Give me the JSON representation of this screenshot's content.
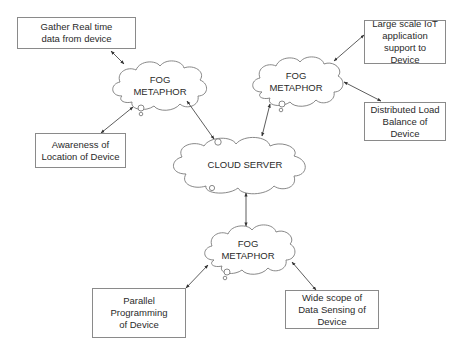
{
  "diagram": {
    "colors": {
      "stroke": "#7a7a7a",
      "arrow": "#333333",
      "box_border": "#8a8a8a",
      "text": "#2a2a2a"
    },
    "clouds": {
      "fog_top_left": {
        "line1": "FOG",
        "line2": "METAPHOR"
      },
      "fog_top_right": {
        "line1": "FOG",
        "line2": "METAPHOR"
      },
      "cloud_server": {
        "label": "CLOUD SERVER"
      },
      "fog_bottom": {
        "line1": "FOG",
        "line2": "METAPHOR"
      }
    },
    "boxes": {
      "gather_data": {
        "label": "Gather Real time data from device"
      },
      "awareness_location": {
        "label": "Awareness of Location of Device"
      },
      "large_scale_iot": {
        "label": "Large scale IoT application support to Device"
      },
      "distributed_load": {
        "label": "Distributed Load Balance of Device"
      },
      "parallel_programming": {
        "label": "Parallel Programming of Device"
      },
      "wide_scope_sensing": {
        "label": "Wide scope of Data Sensing of Device"
      }
    },
    "connections": [
      {
        "from": "gather_data",
        "to": "fog_top_left",
        "type": "bidirectional"
      },
      {
        "from": "awareness_location",
        "to": "fog_top_left",
        "type": "bidirectional"
      },
      {
        "from": "fog_top_left",
        "to": "cloud_server",
        "type": "bidirectional"
      },
      {
        "from": "large_scale_iot",
        "to": "fog_top_right",
        "type": "bidirectional"
      },
      {
        "from": "distributed_load",
        "to": "fog_top_right",
        "type": "bidirectional"
      },
      {
        "from": "fog_top_right",
        "to": "cloud_server",
        "type": "bidirectional"
      },
      {
        "from": "cloud_server",
        "to": "fog_bottom",
        "type": "bidirectional"
      },
      {
        "from": "parallel_programming",
        "to": "fog_bottom",
        "type": "bidirectional"
      },
      {
        "from": "wide_scope_sensing",
        "to": "fog_bottom",
        "type": "bidirectional"
      }
    ]
  }
}
